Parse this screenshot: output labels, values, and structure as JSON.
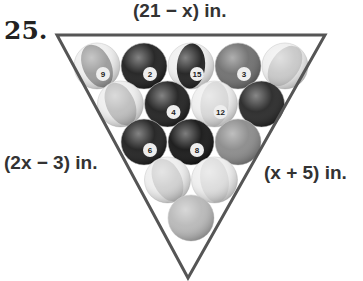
{
  "problem": {
    "number": "25.",
    "side_labels": {
      "top": "(21 − x) in.",
      "left": "(2x − 3) in.",
      "right": "(x + 5) in."
    }
  },
  "figure": {
    "rows": [
      [
        {
          "shade": "#9a9a9a",
          "stripe": true,
          "number": "9"
        },
        {
          "shade": "#1e1e1e",
          "stripe": false,
          "number": "2"
        },
        {
          "shade": "#1e1e1e",
          "stripe": true,
          "number": "15"
        },
        {
          "shade": "#6e6e6e",
          "stripe": false,
          "number": "3"
        },
        {
          "shade": "#c8c8c8",
          "stripe": true,
          "number": ""
        }
      ],
      [
        {
          "shade": "#bdbdbd",
          "stripe": true,
          "number": ""
        },
        {
          "shade": "#1e1e1e",
          "stripe": false,
          "number": "4"
        },
        {
          "shade": "#d8d8d8",
          "stripe": true,
          "number": "12"
        },
        {
          "shade": "#262626",
          "stripe": false,
          "number": ""
        }
      ],
      [
        {
          "shade": "#1e1e1e",
          "stripe": false,
          "number": "6"
        },
        {
          "shade": "#141414",
          "stripe": false,
          "number": "8"
        },
        {
          "shade": "#8a8a8a",
          "stripe": false,
          "number": ""
        }
      ],
      [
        {
          "shade": "#d0d0d0",
          "stripe": true,
          "number": ""
        },
        {
          "shade": "#dcdcdc",
          "stripe": true,
          "number": ""
        }
      ],
      [
        {
          "shade": "#b8b8b8",
          "stripe": false,
          "number": ""
        }
      ]
    ],
    "colors": {
      "rack_outline": "#555555",
      "text": "#333333"
    }
  }
}
